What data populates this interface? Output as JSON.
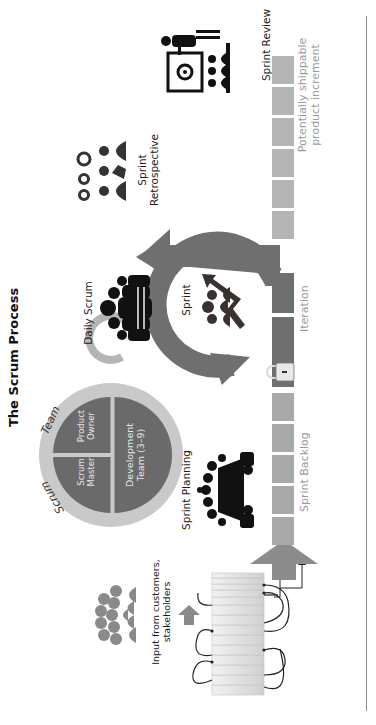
{
  "title": "The Scrum Process",
  "scrum_team": {
    "ring_label_left": "Scrum",
    "ring_label_right": "Team",
    "roles": [
      {
        "label_line1": "Scrum",
        "label_line2": "Master"
      },
      {
        "label_line1": "Product",
        "label_line2": "Owner"
      },
      {
        "label_line1": "Development",
        "label_line2": "Team (3–9)"
      }
    ]
  },
  "stages": {
    "input": {
      "line1": "Input from customers,",
      "line2": "stakeholders",
      "icon": "crowd-icon"
    },
    "sprint_planning": {
      "label": "Sprint Planning",
      "icon": "meeting-table-icon"
    },
    "daily_scrum": {
      "label": "Daily Scrum",
      "icon": "team-huddle-icon"
    },
    "sprint": {
      "label": "Sprint",
      "icon": "team-growth-arrow-icon"
    },
    "sprint_retrospective": {
      "line1": "Sprint",
      "line2": "Retrospective",
      "icon": "gears-people-icon"
    },
    "sprint_review": {
      "label": "Sprint Review",
      "icon": "presentation-board-icon"
    }
  },
  "backlog_labels": {
    "sprint_backlog": "Sprint Backlog",
    "iteration": "Iteration",
    "increment_line1": "Potentially shippable",
    "increment_line2": "product increment"
  },
  "colors": {
    "dark_grey": "#6f6f6f",
    "mid_grey": "#a9a9a9",
    "light_grey": "#cfcfcf",
    "text_grey": "#9a9a9a",
    "black_icon": "#111111"
  }
}
